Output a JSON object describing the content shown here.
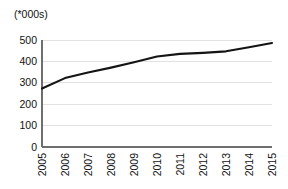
{
  "chart_data": {
    "type": "line",
    "title": "",
    "subtitle": "",
    "unit_caption": "(*000s)",
    "xlabel": "",
    "ylabel": "",
    "categories": [
      "2005",
      "2006",
      "2007",
      "2008",
      "2009",
      "2010",
      "2011",
      "2012",
      "2013",
      "2014",
      "2015"
    ],
    "series": [
      {
        "name": "",
        "values": [
          273,
          322,
          348,
          371,
          396,
          423,
          435,
          440,
          447,
          466,
          486
        ]
      }
    ],
    "ylim": [
      0,
      500
    ],
    "ytick_labels": [
      "0",
      "100",
      "200",
      "300",
      "400",
      "500"
    ],
    "ytick_values": [
      0,
      100,
      200,
      300,
      400,
      500
    ],
    "xtick_labels": [
      "2005",
      "2006",
      "2007",
      "2008",
      "2009",
      "2010",
      "2011",
      "2012",
      "2013",
      "2014",
      "2015"
    ],
    "xtick_rotation": -90,
    "grid": true,
    "grid_axis": "y",
    "legend": false,
    "legend_position": "none",
    "line_color": "#141414",
    "grid_color": "#d9d9d9",
    "axis_color": "#6e6e6e",
    "background_color": "#ffffff"
  },
  "geometry": {
    "plot_left": 42,
    "plot_right": 272,
    "plot_top": 40,
    "plot_bottom": 147
  }
}
